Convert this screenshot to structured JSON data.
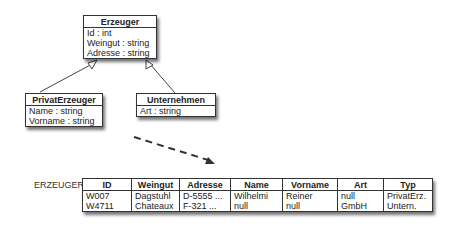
{
  "uml": {
    "erzeuger": {
      "name": "Erzeuger",
      "attrs": [
        "Id : int",
        "Weingut : string",
        "Adresse : string"
      ]
    },
    "privat": {
      "name": "PrivatErzeuger",
      "attrs": [
        "Name : string",
        "Vorname : string"
      ]
    },
    "unternehmen": {
      "name": "Unternehmen",
      "attrs": [
        "Art : string"
      ]
    }
  },
  "relation": {
    "label": "ERZEUGER",
    "columns": [
      "ID",
      "Weingut",
      "Adresse",
      "Name",
      "Vorname",
      "Art",
      "Typ"
    ],
    "rows": [
      [
        "W007",
        "Dagstuhl",
        "D-5555 ...",
        "Wilhelmi",
        "Reiner",
        "null",
        "PrivatErz."
      ],
      [
        "W4711",
        "Chateaux",
        "F-321 ...",
        "null",
        "null",
        "GmbH",
        "Untern."
      ]
    ]
  }
}
